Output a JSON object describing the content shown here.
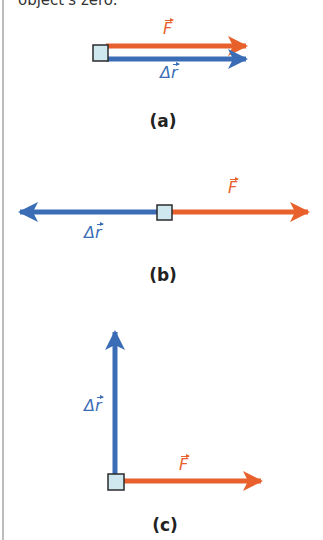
{
  "top_text": "object's zero.",
  "colors": {
    "force": "#e8612c",
    "displacement": "#3a6db5",
    "box_fill": "#cfe8f0",
    "box_stroke": "#2b2b2b"
  },
  "labels": {
    "force": "F",
    "displacement_delta": "Δ",
    "displacement": "r"
  },
  "panels": [
    {
      "id": "a",
      "caption": "(a)",
      "description": "Force and displacement parallel, same direction"
    },
    {
      "id": "b",
      "caption": "(b)",
      "description": "Force and displacement antiparallel"
    },
    {
      "id": "c",
      "caption": "(c)",
      "description": "Force perpendicular to displacement"
    }
  ]
}
